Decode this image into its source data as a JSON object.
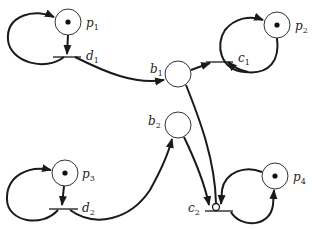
{
  "diagram": {
    "type": "petri-net",
    "places": [
      {
        "id": "p1",
        "name": "p",
        "sub": "1",
        "x": 68,
        "y": 22,
        "tokens": 1
      },
      {
        "id": "p2",
        "name": "p",
        "sub": "2",
        "x": 277,
        "y": 25,
        "tokens": 1
      },
      {
        "id": "p3",
        "name": "p",
        "sub": "3",
        "x": 65,
        "y": 173,
        "tokens": 1
      },
      {
        "id": "p4",
        "name": "p",
        "sub": "4",
        "x": 275,
        "y": 176,
        "tokens": 1
      },
      {
        "id": "b1",
        "name": "b",
        "sub": "1",
        "x": 178,
        "y": 74,
        "tokens": 0
      },
      {
        "id": "b2",
        "name": "b",
        "sub": "2",
        "x": 178,
        "y": 125,
        "tokens": 0
      }
    ],
    "transitions": [
      {
        "id": "d1",
        "name": "d",
        "sub": "1"
      },
      {
        "id": "d2",
        "name": "d",
        "sub": "2"
      },
      {
        "id": "c1",
        "name": "c",
        "sub": "1"
      },
      {
        "id": "c2",
        "name": "c",
        "sub": "2"
      }
    ],
    "arcs": [
      {
        "from": "p1",
        "to": "d1"
      },
      {
        "from": "d1",
        "to": "p1"
      },
      {
        "from": "d1",
        "to": "b1"
      },
      {
        "from": "b1",
        "to": "c1"
      },
      {
        "from": "p2",
        "to": "c1"
      },
      {
        "from": "c1",
        "to": "p2"
      },
      {
        "from": "p3",
        "to": "d2"
      },
      {
        "from": "d2",
        "to": "p3"
      },
      {
        "from": "d2",
        "to": "b2"
      },
      {
        "from": "b2",
        "to": "c2"
      },
      {
        "from": "b1",
        "to": "c2",
        "kind": "inhibitor"
      },
      {
        "from": "p4",
        "to": "c2"
      },
      {
        "from": "c2",
        "to": "p4"
      }
    ]
  }
}
